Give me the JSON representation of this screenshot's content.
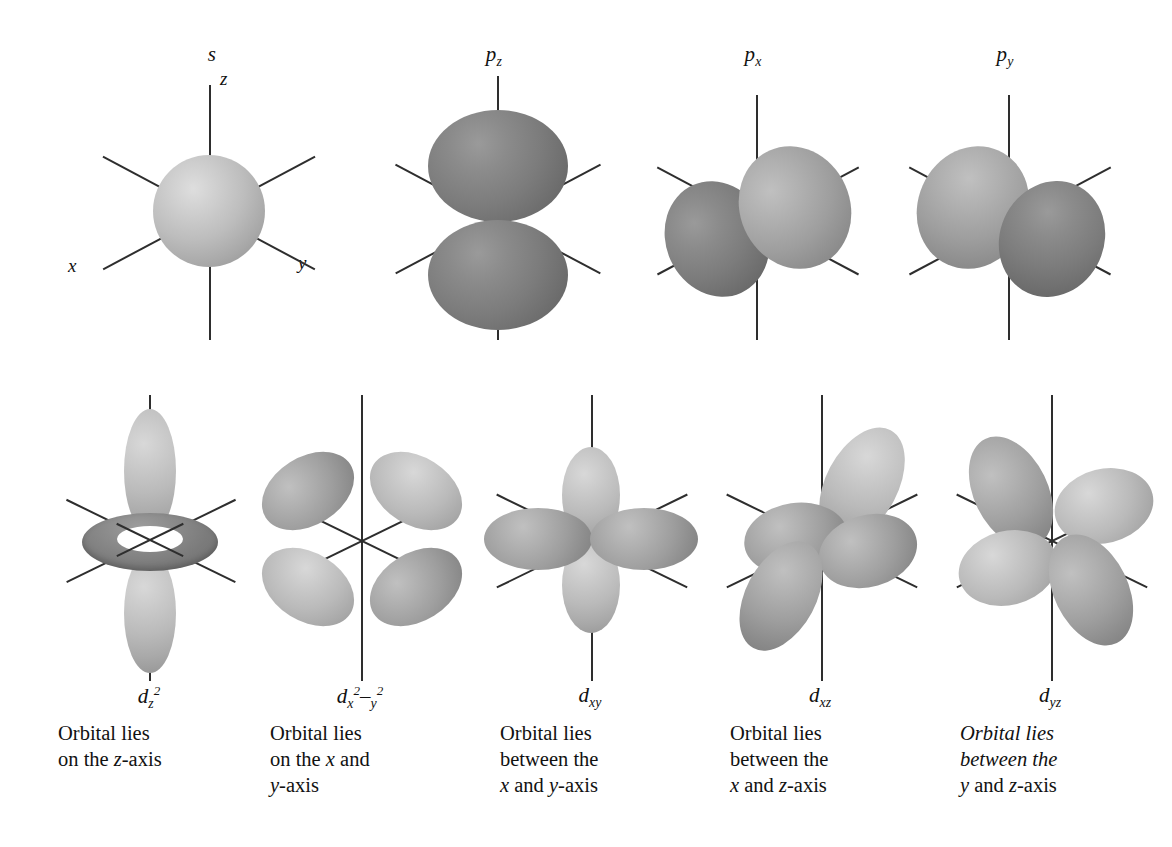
{
  "figure": {
    "background_color": "#ffffff",
    "axis_color": "#2e2e2e",
    "lobe_dark_color": "#7c7c7c",
    "lobe_light_color": "#bababa",
    "sphere_color": "#bdbdbd"
  },
  "axis_labels": {
    "z": "z",
    "x": "x",
    "y": "y"
  },
  "row1": {
    "orbitals": [
      {
        "id": "s",
        "label_base": "s",
        "label_sub": "",
        "shape": "sphere",
        "description": "Spherical orbital centred on the nucleus"
      },
      {
        "id": "pz",
        "label_base": "p",
        "label_sub": "z",
        "shape": "two-lobe",
        "description": "Two lobes along the z-axis"
      },
      {
        "id": "px",
        "label_base": "p",
        "label_sub": "x",
        "shape": "two-lobe",
        "description": "Two lobes along the x-axis"
      },
      {
        "id": "py",
        "label_base": "p",
        "label_sub": "y",
        "shape": "two-lobe",
        "description": "Two lobes along the y-axis"
      }
    ]
  },
  "row2": {
    "orbitals": [
      {
        "id": "dz2",
        "label_base": "d",
        "label_sub": "z",
        "label_sup": "2",
        "shape": "two-lobe-with-torus",
        "caption_lines": [
          "Orbital lies",
          "on the z-axis"
        ],
        "caption_italic": false
      },
      {
        "id": "dx2-y2",
        "label_base": "d",
        "label_sub1": "x",
        "label_sup1": "2",
        "label_mid": "–",
        "label_sub2": "y",
        "label_sup2": "2",
        "shape": "four-lobe",
        "caption_lines": [
          "Orbital lies",
          "on the x and",
          "y-axis"
        ],
        "caption_italic": false
      },
      {
        "id": "dxy",
        "label_base": "d",
        "label_sub": "xy",
        "shape": "four-lobe",
        "caption_lines": [
          "Orbital lies",
          "between the",
          "x and y-axis"
        ],
        "caption_italic": false
      },
      {
        "id": "dxz",
        "label_base": "d",
        "label_sub": "xz",
        "shape": "four-lobe",
        "caption_lines": [
          "Orbital lies",
          "between the",
          "x and z-axis"
        ],
        "caption_italic": false
      },
      {
        "id": "dyz",
        "label_base": "d",
        "label_sub": "yz",
        "shape": "four-lobe",
        "caption_lines": [
          "Orbital lies",
          "between the",
          "y and z-axis"
        ],
        "caption_italic": true
      }
    ]
  }
}
